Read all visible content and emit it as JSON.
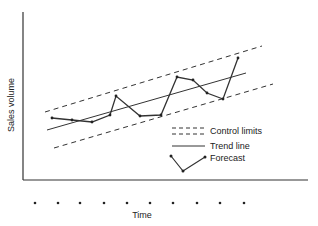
{
  "chart_data": {
    "type": "line",
    "title": "",
    "xlabel": "Time",
    "ylabel": "Sales volume",
    "grid": false,
    "legend_position": "lower-right-inside",
    "legend": [
      {
        "label": "Control limits",
        "style": "dashed"
      },
      {
        "label": "Trend line",
        "style": "solid"
      },
      {
        "label": "Forecast",
        "style": "solid-with-markers"
      }
    ],
    "x_ticks": 10,
    "series": [
      {
        "name": "Forecast",
        "points": [
          [
            52,
            118
          ],
          [
            72,
            120
          ],
          [
            92,
            122
          ],
          [
            110,
            115
          ],
          [
            116,
            96
          ],
          [
            140,
            116
          ],
          [
            161,
            115
          ],
          [
            177,
            77
          ],
          [
            193,
            80
          ],
          [
            207,
            93
          ],
          [
            223,
            99
          ],
          [
            238,
            58
          ]
        ]
      },
      {
        "name": "Trend line",
        "points": [
          [
            47,
            130
          ],
          [
            246,
            73
          ]
        ]
      },
      {
        "name": "Upper control limit",
        "points": [
          [
            45,
            112
          ],
          [
            262,
            46
          ]
        ]
      },
      {
        "name": "Lower control limit",
        "points": [
          [
            54,
            148
          ],
          [
            273,
            84
          ]
        ]
      }
    ],
    "time_dots_x": [
      35,
      58,
      80,
      104,
      127,
      150,
      173,
      197,
      220,
      244
    ]
  },
  "labels": {
    "ylabel": "Sales volume",
    "xlabel": "Time",
    "legend_control": "Control limits",
    "legend_trend": "Trend line",
    "legend_forecast": "Forecast"
  }
}
